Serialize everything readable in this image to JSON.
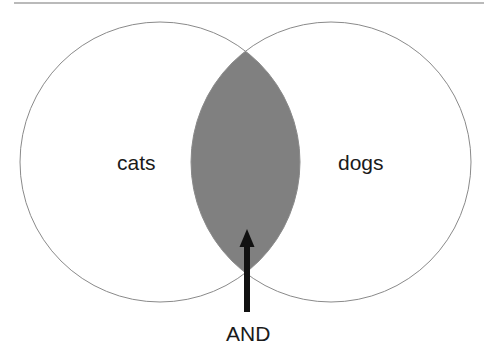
{
  "diagram": {
    "type": "venn",
    "sets": [
      {
        "label": "cats"
      },
      {
        "label": "dogs"
      }
    ],
    "intersection": {
      "label": "AND",
      "fill": "#808080"
    },
    "stroke": "#8a8a8a",
    "arrow_color": "#111111"
  }
}
